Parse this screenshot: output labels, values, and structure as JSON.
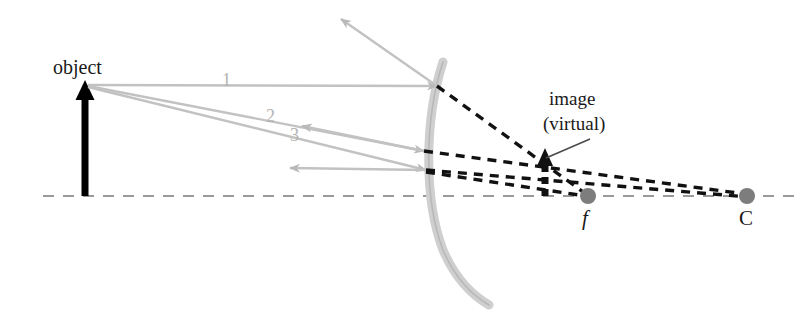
{
  "diagram": {
    "labels": {
      "object": "object",
      "image_line1": "image",
      "image_line2": "(virtual)",
      "focal_point": "f",
      "center_of_curvature": "C",
      "ray1": "1",
      "ray2": "2",
      "ray3": "3"
    },
    "colors": {
      "incident_ray": "#b9b9b9",
      "reflected_ray": "#b9b9b9",
      "mirror": "#cccccc",
      "axis": "#9a9a9a",
      "object_arrow": "#000000",
      "virtual_ray": "#111111",
      "point_marker": "#777777",
      "text": "#1a1a1a",
      "background": "#ffffff"
    },
    "geometry": {
      "axis_y": 196,
      "object_x": 85,
      "object_tip_y": 85,
      "focal_point_x": 588,
      "center_x": 747,
      "image_x": 545,
      "image_tip_y": 152,
      "mirror_vertex_x": 432
    }
  }
}
